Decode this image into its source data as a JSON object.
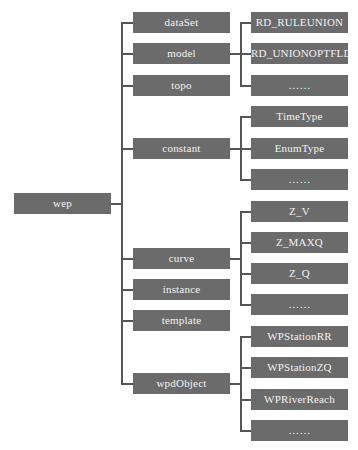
{
  "diagram": {
    "type": "tree",
    "root": {
      "label": "wep"
    },
    "level1": [
      {
        "label": "dataSet"
      },
      {
        "label": "model"
      },
      {
        "label": "topo"
      },
      {
        "label": "constant"
      },
      {
        "label": "curve"
      },
      {
        "label": "instance"
      },
      {
        "label": "template"
      },
      {
        "label": "wpdObject"
      }
    ],
    "level2": {
      "model": [
        "RD_RULEUNION",
        "RD_UNIONOPTFLD",
        "……"
      ],
      "constant": [
        "TimeType",
        "EnumType",
        "……"
      ],
      "curve": [
        "Z_V",
        "Z_MAXQ",
        "Z_Q",
        "……"
      ],
      "wpdObject": [
        "WPStationRR",
        "WPStationZQ",
        "WPRiverReach",
        "……"
      ]
    },
    "colors": {
      "box": "#6b6b6b",
      "text": "#f2f2f2",
      "line": "#555555"
    }
  }
}
